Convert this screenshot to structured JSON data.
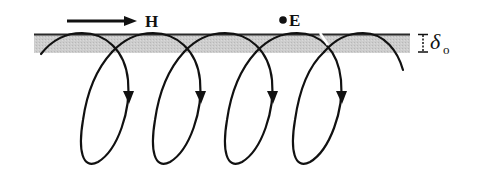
{
  "figure": {
    "type": "electromagnetic field diagram",
    "labels": {
      "magnetic_field": "H",
      "electric_field": "E",
      "skin_depth_symbol": "δ",
      "skin_depth_subscript": "o"
    },
    "elements": {
      "surface_layer": {
        "description": "shaded skin-depth layer",
        "fill": "#c8c8c8",
        "edge": "#222222"
      },
      "field_loops": {
        "count": 4,
        "direction": "clockwise-down arrows on right side",
        "stroke": "#111111"
      },
      "h_arrow": {
        "direction": "right"
      },
      "e_marker": {
        "symbol": "dot (out of page)"
      }
    },
    "colors": {
      "ink": "#111111",
      "band": "#c8c8c8",
      "background": "#ffffff"
    }
  }
}
